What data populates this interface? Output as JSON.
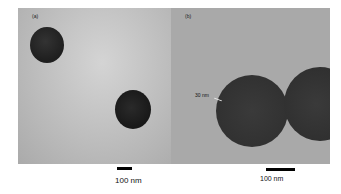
{
  "figure": {
    "panel_a": {
      "label": "(a)",
      "scale_bar": "100 nm"
    },
    "panel_b": {
      "label": "(b)",
      "scale_bar": "100 nm",
      "annotation": "30 nm"
    }
  },
  "colors": {
    "background_a": "#bdbdbd",
    "background_b": "#a9a9a9",
    "particle": "#2a2a2a"
  }
}
